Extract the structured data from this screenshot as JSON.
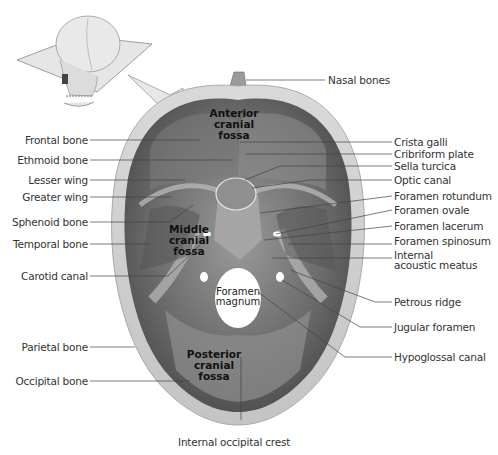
{
  "figure": {
    "inset": {
      "description": "skull with horizontal cutting plane",
      "arrow": "pointing to cranial floor view"
    },
    "regions": {
      "anterior": [
        "Anterior",
        "cranial",
        "fossa"
      ],
      "middle": [
        "Middle",
        "cranial",
        "fossa"
      ],
      "posterior": [
        "Posterior",
        "cranial",
        "fossa"
      ],
      "foramen_magnum": [
        "Foramen",
        "magnum"
      ]
    },
    "labels_left": [
      "Frontal bone",
      "Ethmoid bone",
      "Lesser wing",
      "Greater wing",
      "Sphenoid bone",
      "Temporal bone",
      "Carotid canal",
      "Parietal bone",
      "Occipital bone"
    ],
    "labels_right": [
      "Nasal bones",
      "Crista galli",
      "Cribriform plate",
      "Sella turcica",
      "Optic canal",
      "Foramen rotundum",
      "Foramen ovale",
      "Foramen lacerum",
      "Foramen spinosum",
      "Internal",
      "acoustic meatus",
      "Petrous ridge",
      "Jugular foramen",
      "Hypoglossal canal"
    ],
    "label_bottom": "Internal occipital crest"
  }
}
